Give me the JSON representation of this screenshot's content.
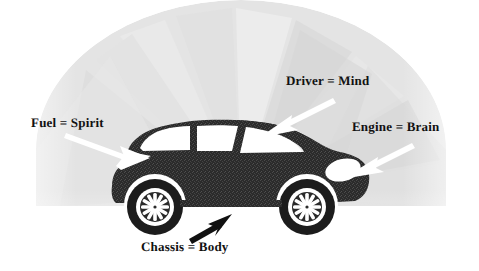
{
  "diagram": {
    "background_shape": "fan-dome",
    "colors": {
      "background": "#ffffff",
      "fan_light": "#e6e6e6",
      "fan_mid": "#dcdcdc",
      "fan_dark": "#d2d2d2",
      "car_body": "#2b2b2b",
      "car_body_texture": "#3a3a3a",
      "window": "#ffffff",
      "wheel_tire": "#1c1c1c",
      "wheel_rim": "#ffffff",
      "arrow_white": "#ffffff",
      "arrow_black": "#111111",
      "text": "#111111"
    },
    "labels": [
      {
        "id": "fuel",
        "text": "Fuel = Spirit",
        "arrow_color": "#ffffff",
        "arrow_direction": "right",
        "points_to": "fuel-cap"
      },
      {
        "id": "driver",
        "text": "Driver = Mind",
        "arrow_color": "#ffffff",
        "arrow_direction": "down-left",
        "points_to": "cabin"
      },
      {
        "id": "engine",
        "text": "Engine = Brain",
        "arrow_color": "#ffffff",
        "arrow_direction": "left",
        "points_to": "front-hood"
      },
      {
        "id": "chassis",
        "text": "Chassis = Body",
        "arrow_color": "#111111",
        "arrow_direction": "up-right",
        "points_to": "underbody"
      }
    ]
  }
}
